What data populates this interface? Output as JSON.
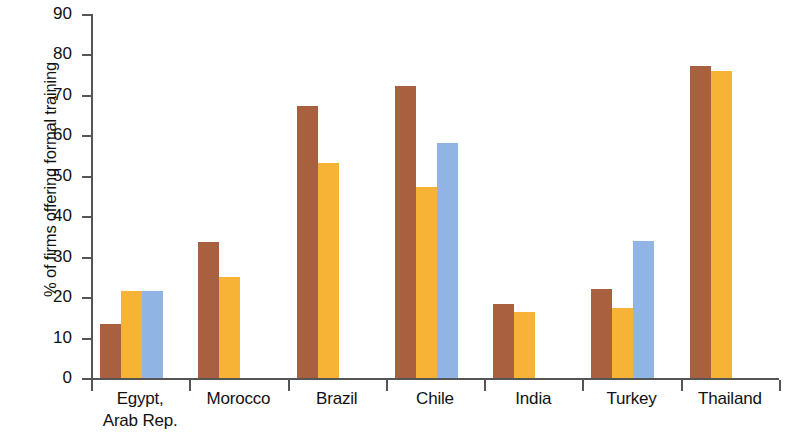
{
  "chart_data": {
    "type": "bar",
    "title": "",
    "subtitle": "",
    "xlabel": "",
    "ylabel": "% of firms offering formal training",
    "ylim": [
      0,
      90
    ],
    "ytick_labels": [
      "0",
      "10",
      "20",
      "30",
      "40",
      "50",
      "60",
      "70",
      "80",
      "90"
    ],
    "ytick_values": [
      0,
      10,
      20,
      30,
      40,
      50,
      60,
      70,
      80,
      90
    ],
    "grid": false,
    "legend": "none",
    "categories": [
      "Egypt,\nArab Rep.",
      "Morocco",
      "Brazil",
      "Chile",
      "India",
      "Turkey",
      "Thailand"
    ],
    "series": [
      {
        "name": "series-1",
        "color": "#a9603f",
        "values": [
          13.4,
          33.7,
          67.3,
          72.2,
          18.3,
          21.9,
          77.1
        ]
      },
      {
        "name": "series-2",
        "color": "#f6b335",
        "values": [
          21.4,
          25.0,
          53.1,
          47.2,
          16.4,
          17.4,
          76.0
        ]
      },
      {
        "name": "series-3",
        "color": "#90b4e4",
        "values": [
          21.6,
          null,
          null,
          58.0,
          null,
          33.8,
          null
        ]
      }
    ]
  },
  "colors": {
    "series_1": "#a9603f",
    "series_2": "#f6b335",
    "series_3": "#90b4e4",
    "axis": "#555555",
    "text": "#111111",
    "background": "#ffffff"
  }
}
